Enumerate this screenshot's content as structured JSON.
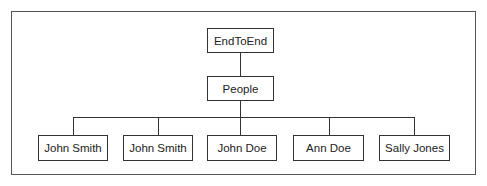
{
  "diagram": {
    "type": "hierarchy-tree",
    "root": {
      "label": "EndToEnd"
    },
    "level1": {
      "label": "People"
    },
    "leaves": [
      {
        "label": "John Smith"
      },
      {
        "label": "John Smith"
      },
      {
        "label": "John Doe"
      },
      {
        "label": "Ann Doe"
      },
      {
        "label": "Sally Jones"
      }
    ],
    "edges": [
      [
        "EndToEnd",
        "People"
      ],
      [
        "People",
        "John Smith"
      ],
      [
        "People",
        "John Smith"
      ],
      [
        "People",
        "John Doe"
      ],
      [
        "People",
        "Ann Doe"
      ],
      [
        "People",
        "Sally Jones"
      ]
    ],
    "colors": {
      "stroke": "#333333",
      "frame": "#555555",
      "background": "#ffffff",
      "text": "#222222"
    }
  }
}
